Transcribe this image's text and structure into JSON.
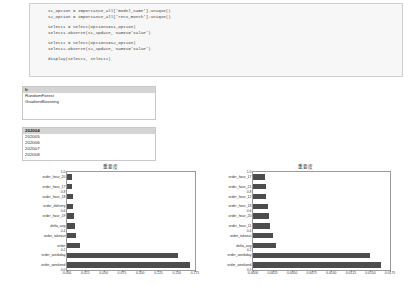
{
  "code_cell": {
    "lines": [
      "s1_option = importance_all['model_name'].unique()",
      "s2_option = importance_all['recv_month'].unique()",
      "",
      "select1 = Select(options=s1_option)",
      "select1.observe(s1_update, names='value')",
      "",
      "select2 = Select(options=s2_option)",
      "select2.observe(s2_update, names='value')",
      "",
      "display(select1, select2)"
    ]
  },
  "select_model": {
    "options": [
      "lr",
      "RandomForest",
      "GradientBoosting"
    ],
    "selected_index": 0
  },
  "select_month": {
    "options": [
      "202004",
      "202005",
      "202006",
      "202007",
      "202008"
    ],
    "selected_index": 0
  },
  "chart_data": [
    {
      "type": "bar",
      "orientation": "horizontal",
      "title": "重要度",
      "xlabel": "",
      "ylabel": "",
      "xlim": [
        0.0,
        0.175
      ],
      "xticks": [
        "0.000",
        "0.025",
        "0.050",
        "0.075",
        "0.100",
        "0.125",
        "0.150",
        "0.175"
      ],
      "xtick_values": [
        0.0,
        0.025,
        0.05,
        0.075,
        0.1,
        0.125,
        0.15,
        0.175
      ],
      "yticks": [
        "0.0",
        "0.2",
        "0.4",
        "0.6",
        "0.8",
        "1.0"
      ],
      "grid": false,
      "legend": "none",
      "categories": [
        "order_weekend",
        "order_weekday",
        "order",
        "order_takeout",
        "delta_avg",
        "order_hour_19",
        "order_delivery",
        "order_hour_18",
        "order_hour_17",
        "order_hour_20"
      ],
      "values": [
        0.168,
        0.152,
        0.0175,
        0.0125,
        0.0105,
        0.0095,
        0.0085,
        0.0078,
        0.0072,
        0.0065
      ]
    },
    {
      "type": "bar",
      "orientation": "horizontal",
      "title": "重要度",
      "xlabel": "",
      "ylabel": "",
      "xlim": [
        0.0,
        0.0175
      ],
      "xticks": [
        "0.0000",
        "0.0025",
        "0.0050",
        "0.0075",
        "0.0100",
        "0.0125",
        "0.0150",
        "0.0175"
      ],
      "xtick_values": [
        0.0,
        0.0025,
        0.005,
        0.0075,
        0.01,
        0.0125,
        0.015,
        0.0175
      ],
      "yticks": [
        "0.0",
        "0.2",
        "0.4",
        "0.6",
        "0.8",
        "1.0"
      ],
      "grid": false,
      "legend": "none",
      "categories": [
        "order_weekend",
        "order_weekday",
        "delta_avg",
        "order_takeout",
        "order_hour_11",
        "order_hour_20",
        "order_hour_18",
        "order_hour_12",
        "order_hour_21",
        "order_hour_17"
      ],
      "values": [
        0.0163,
        0.015,
        0.003,
        0.0026,
        0.0022,
        0.002,
        0.0019,
        0.0017,
        0.0016,
        0.0015
      ]
    }
  ]
}
